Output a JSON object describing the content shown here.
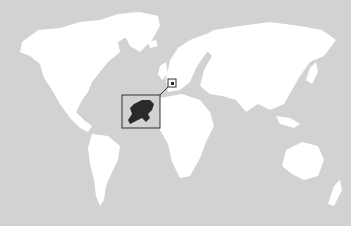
{
  "map": {
    "type": "world-locator-map",
    "highlighted_country": "Netherlands",
    "colors": {
      "ocean": "#d2d2d2",
      "land": "#ffffff",
      "highlight": "#2a2a2a",
      "frame": "#333333"
    },
    "features": [
      {
        "name": "North America"
      },
      {
        "name": "Greenland"
      },
      {
        "name": "South America"
      },
      {
        "name": "Europe"
      },
      {
        "name": "Africa"
      },
      {
        "name": "Asia"
      },
      {
        "name": "Australia"
      },
      {
        "name": "New Zealand"
      },
      {
        "name": "Antarctica"
      }
    ],
    "inset": {
      "label": "Netherlands detail"
    },
    "locator_marker": {
      "label": "Netherlands location"
    }
  }
}
